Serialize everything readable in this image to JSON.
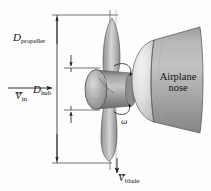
{
  "figure": {
    "name": "airplane-propeller-diagram",
    "background_color": "#fdfdfd",
    "width": 211,
    "height": 191
  },
  "labels": {
    "d_propeller": {
      "symbol": "D",
      "subscript": "propeller"
    },
    "d_hub": {
      "symbol": "D",
      "subscript": "hub"
    },
    "v_in": {
      "symbol": "V",
      "subscript": "in"
    },
    "v_blade": {
      "symbol": "V",
      "subscript": "blade"
    },
    "omega": {
      "symbol": "ω"
    },
    "airplane_nose": {
      "line1": "Airplane",
      "line2": "nose"
    }
  },
  "colors": {
    "line": "#1a1a1a",
    "blade_light": "#d8d8d8",
    "blade_mid": "#a9a9a9",
    "blade_dark": "#7f7f7f",
    "hub_light": "#cfcfcf",
    "hub_mid": "#9a9a9a",
    "hub_dark": "#6f6f6f",
    "spinner_light": "#eeeeee",
    "spinner_mid": "#c9c9c9",
    "cone_light": "#bdbdbd",
    "cone_mid": "#9d9d9d",
    "cone_dark": "#7a7a7a",
    "text": "#111111"
  },
  "geometry": {
    "propeller_axis_x": 110,
    "dimension_line_propeller_x": 57,
    "dimension_line_hub_x": 71,
    "propeller_top_y": 15,
    "propeller_bottom_y": 163,
    "hub_top_y": 68,
    "hub_bottom_y": 110,
    "v_in_arrow": {
      "x1": 8,
      "y1": 88,
      "x2": 53,
      "y2": 88
    },
    "v_blade_arrow": {
      "x1": 117,
      "y1": 158,
      "x2": 117,
      "y2": 174
    }
  },
  "elements": {
    "upper_blade": "propeller-blade-upper",
    "lower_blade": "propeller-blade-lower",
    "hub": "propeller-hub-cylinder",
    "spinner": "nose-spinner-cap",
    "cone": "airplane-nose-cone",
    "rotation_arrow": "rotation-direction-arrow"
  }
}
